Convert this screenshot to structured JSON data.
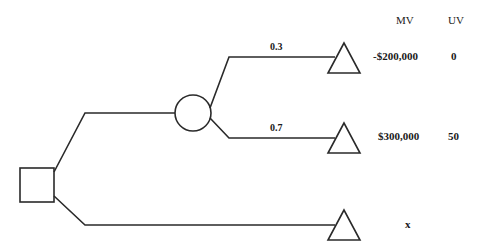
{
  "diagram": {
    "type": "decision-tree",
    "headers": {
      "mv": "MV",
      "uv": "UV"
    },
    "decision_node": {
      "shape": "square"
    },
    "chance_node": {
      "shape": "circle"
    },
    "branches": [
      {
        "probability": "0.3",
        "mv": "-$200,000",
        "uv": "0"
      },
      {
        "probability": "0.7",
        "mv": "$300,000",
        "uv": "50"
      },
      {
        "probability": "",
        "mv": "",
        "uv": "x"
      }
    ],
    "colors": {
      "line": "#2a2a2a",
      "background": "#ffffff"
    }
  }
}
